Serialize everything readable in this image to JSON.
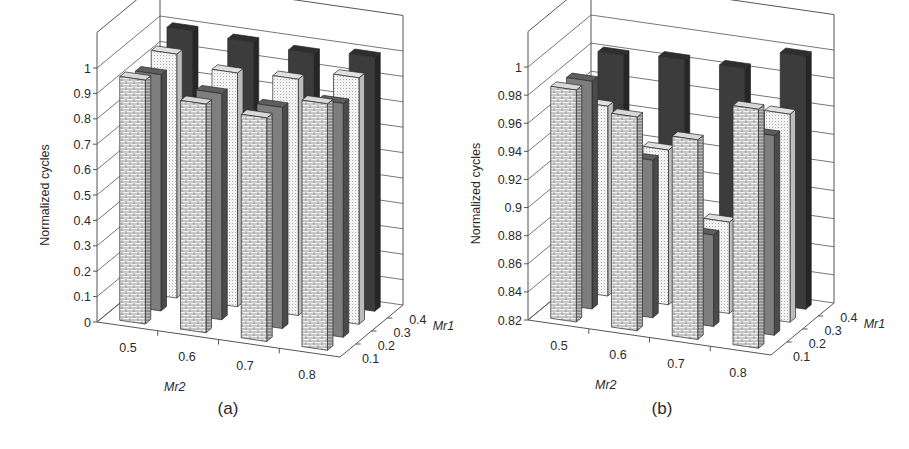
{
  "chart_data": [
    {
      "id": "a",
      "type": "bar3d",
      "caption": "(a)",
      "title": "",
      "xlabel": "Mr2",
      "zlabel": "Mr1",
      "ylabel": "Normalized cycles",
      "categories": [
        "0.5",
        "0.6",
        "0.7",
        "0.8"
      ],
      "depth_categories": [
        "0.1",
        "0.2",
        "0.3",
        "0.4"
      ],
      "yticks": [
        "0",
        "0.1",
        "0.2",
        "0.3",
        "0.4",
        "0.5",
        "0.6",
        "0.7",
        "0.8",
        "0.9",
        "1"
      ],
      "ylim": [
        0,
        1
      ],
      "grid": true,
      "series": [
        {
          "name": "Mr1=0.1",
          "pattern": "brick",
          "values": [
            0.96,
            0.9,
            0.88,
            0.97
          ]
        },
        {
          "name": "Mr1=0.2",
          "pattern": "solid-gray",
          "values": [
            0.93,
            0.89,
            0.87,
            0.92
          ]
        },
        {
          "name": "Mr1=0.3",
          "pattern": "dotted-light",
          "values": [
            0.96,
            0.92,
            0.93,
            0.97
          ]
        },
        {
          "name": "Mr1=0.4",
          "pattern": "solid-dark",
          "values": [
            1.0,
            0.99,
            0.98,
            1.0
          ]
        }
      ]
    },
    {
      "id": "b",
      "type": "bar3d",
      "caption": "(b)",
      "title": "",
      "xlabel": "Mr2",
      "zlabel": "Mr1",
      "ylabel": "Normalized cycles",
      "categories": [
        "0.5",
        "0.6",
        "0.7",
        "0.8"
      ],
      "depth_categories": [
        "0.1",
        "0.2",
        "0.3",
        "0.4"
      ],
      "yticks": [
        "0.82",
        "0.84",
        "0.86",
        "0.88",
        "0.9",
        "0.92",
        "0.94",
        "0.96",
        "0.98",
        "1"
      ],
      "ylim": [
        0.82,
        1
      ],
      "grid": true,
      "series": [
        {
          "name": "Mr1=0.1",
          "pattern": "brick",
          "values": [
            0.985,
            0.972,
            0.962,
            0.99
          ]
        },
        {
          "name": "Mr1=0.2",
          "pattern": "solid-gray",
          "values": [
            0.982,
            0.932,
            0.885,
            0.962
          ]
        },
        {
          "name": "Mr1=0.3",
          "pattern": "dotted-light",
          "values": [
            0.955,
            0.93,
            0.885,
            0.968
          ]
        },
        {
          "name": "Mr1=0.4",
          "pattern": "solid-dark",
          "values": [
            0.982,
            0.985,
            0.985,
            1.0
          ]
        }
      ]
    }
  ],
  "colors": {
    "brick_face": "#bdbdbd",
    "brick_mortar": "#efefef",
    "gray_face": "#7d7d7d",
    "dotted_face": "#ededed",
    "dark_face": "#3a3a3a",
    "axis": "#555555"
  }
}
